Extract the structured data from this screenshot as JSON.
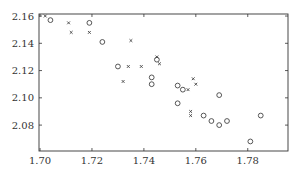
{
  "chart_data": {
    "type": "scatter",
    "title": "",
    "xlabel": "",
    "ylabel": "",
    "xlim": [
      1.6996,
      1.7955
    ],
    "ylim": [
      2.061,
      2.1615
    ],
    "grid": false,
    "legend": null,
    "x_ticks": [
      "1.70",
      "1.72",
      "1.74",
      "1.76",
      "1.78"
    ],
    "y_ticks": [
      "2.08",
      "2.10",
      "2.12",
      "2.14",
      "2.16"
    ],
    "series": [
      {
        "name": "circles",
        "marker": "o",
        "points": [
          [
            1.704,
            2.157
          ],
          [
            1.719,
            2.155
          ],
          [
            1.724,
            2.141
          ],
          [
            1.73,
            2.123
          ],
          [
            1.745,
            2.128
          ],
          [
            1.743,
            2.115
          ],
          [
            1.743,
            2.11
          ],
          [
            1.753,
            2.109
          ],
          [
            1.755,
            2.106
          ],
          [
            1.769,
            2.102
          ],
          [
            1.753,
            2.096
          ],
          [
            1.763,
            2.087
          ],
          [
            1.766,
            2.083
          ],
          [
            1.769,
            2.08
          ],
          [
            1.772,
            2.083
          ],
          [
            1.785,
            2.087
          ],
          [
            1.781,
            2.068
          ]
        ]
      },
      {
        "name": "crosses",
        "marker": "x",
        "points": [
          [
            1.702,
            2.16
          ],
          [
            1.711,
            2.155
          ],
          [
            1.712,
            2.148
          ],
          [
            1.719,
            2.148
          ],
          [
            1.735,
            2.142
          ],
          [
            1.734,
            2.123
          ],
          [
            1.739,
            2.123
          ],
          [
            1.745,
            2.13
          ],
          [
            1.746,
            2.125
          ],
          [
            1.732,
            2.112
          ],
          [
            1.759,
            2.114
          ],
          [
            1.76,
            2.11
          ],
          [
            1.757,
            2.106
          ],
          [
            1.758,
            2.09
          ],
          [
            1.758,
            2.087
          ]
        ]
      }
    ]
  },
  "colors": {
    "axis": "#333333",
    "marker": "#444444",
    "background": "#ffffff"
  }
}
